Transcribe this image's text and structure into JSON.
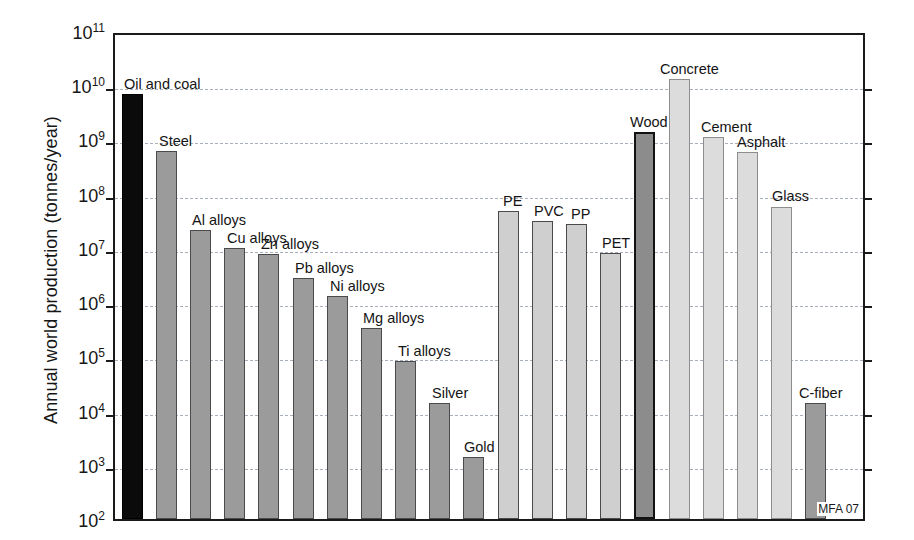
{
  "chart_data": {
    "type": "bar",
    "title": "",
    "subtitle": "",
    "xlabel": "",
    "ylabel": "Annual world production (tonnes/year)",
    "yscale": "log",
    "ylim": [
      100,
      100000000000
    ],
    "grid": true,
    "legend": null,
    "annotation": "MFA 07",
    "ytick_labels": [
      "10²",
      "10³",
      "10⁴",
      "10⁵",
      "10⁶",
      "10⁷",
      "10⁸",
      "10⁹",
      "10¹⁰",
      "10¹¹"
    ],
    "ytick_values": [
      100,
      1000,
      10000,
      100000,
      1000000,
      10000000,
      100000000,
      1000000000,
      10000000000,
      100000000000
    ],
    "categories": [
      "Oil and coal",
      "Steel",
      "Al alloys",
      "Cu alloys",
      "Zn alloys",
      "Pb alloys",
      "Ni alloys",
      "Mg alloys",
      "Ti alloys",
      "Silver",
      "Gold",
      "PE",
      "PVC",
      "PP",
      "PET",
      "Wood",
      "Concrete",
      "Cement",
      "Asphalt",
      "Glass",
      "C-fiber"
    ],
    "values": [
      7000000000,
      600000000,
      21000000,
      10000000,
      7800000,
      2800000,
      1300000,
      330000,
      82000,
      14000,
      1400,
      48000000,
      31000000,
      28000000,
      8000000,
      1350000000,
      13000000000,
      1100000000,
      580000000,
      58000000,
      14000
    ],
    "bars": [
      {
        "label": "Oil and coal",
        "value": 7000000000,
        "slot": 0,
        "class": "fuel",
        "label_dx": 2,
        "label_dy": -21
      },
      {
        "label": "Steel",
        "value": 600000000,
        "slot": 1,
        "class": "metal",
        "label_dx": 3,
        "label_dy": -21
      },
      {
        "label": "Al alloys",
        "value": 21000000,
        "slot": 2,
        "class": "metal",
        "label_dx": 2,
        "label_dy": -21
      },
      {
        "label": "Cu alloys",
        "value": 10000000,
        "slot": 3,
        "class": "metal",
        "label_dx": 3,
        "label_dy": -21
      },
      {
        "label": "Zn alloys",
        "value": 7800000,
        "slot": 4,
        "class": "metal",
        "label_dx": 3,
        "label_dy": -21
      },
      {
        "label": "Pb alloys",
        "value": 2800000,
        "slot": 5,
        "class": "metal",
        "label_dx": 2,
        "label_dy": -21
      },
      {
        "label": "Ni alloys",
        "value": 1300000,
        "slot": 6,
        "class": "metal",
        "label_dx": 3,
        "label_dy": -21
      },
      {
        "label": "Mg alloys",
        "value": 330000,
        "slot": 7,
        "class": "metal",
        "label_dx": 2,
        "label_dy": -21
      },
      {
        "label": "Ti alloys",
        "value": 82000,
        "slot": 8,
        "class": "metal",
        "label_dx": 3,
        "label_dy": -21
      },
      {
        "label": "Silver",
        "value": 14000,
        "slot": 9,
        "class": "metal",
        "label_dx": 3,
        "label_dy": -21
      },
      {
        "label": "Gold",
        "value": 1400,
        "slot": 10,
        "class": "metal",
        "label_dx": 1,
        "label_dy": -21
      },
      {
        "label": "PE",
        "value": 48000000,
        "slot": 11,
        "class": "polymer",
        "label_dx": 5,
        "label_dy": -21
      },
      {
        "label": "PVC",
        "value": 31000000,
        "slot": 12,
        "class": "polymer",
        "label_dx": 2,
        "label_dy": -21
      },
      {
        "label": "PP",
        "value": 28000000,
        "slot": 13,
        "class": "polymer",
        "label_dx": 5,
        "label_dy": -21
      },
      {
        "label": "PET",
        "value": 8000000,
        "slot": 14,
        "class": "polymer",
        "label_dx": 2,
        "label_dy": -21
      },
      {
        "label": "Wood",
        "value": 1350000000,
        "slot": 15,
        "class": "natural",
        "label_dx": -4,
        "label_dy": -21
      },
      {
        "label": "Concrete",
        "value": 13000000000,
        "slot": 16,
        "class": "ceramic",
        "label_dx": -9,
        "label_dy": -21
      },
      {
        "label": "Cement",
        "value": 1100000000,
        "slot": 17,
        "class": "ceramic",
        "label_dx": -2,
        "label_dy": -21
      },
      {
        "label": "Asphalt",
        "value": 580000000,
        "slot": 18,
        "class": "ceramic",
        "label_dx": 0,
        "label_dy": -21
      },
      {
        "label": "Glass",
        "value": 58000000,
        "slot": 19,
        "class": "ceramic",
        "label_dx": 1,
        "label_dy": -21
      },
      {
        "label": "C-fiber",
        "value": 14000,
        "slot": 20,
        "class": "composite",
        "label_dx": -6,
        "label_dy": -21
      }
    ],
    "slot_count": 22,
    "gap_slot": 15
  },
  "colors": {
    "fuel": "#0b0b0b",
    "metal": "#9b9b9b",
    "polymer": "#cfcfcf",
    "natural": "#8c8c8c",
    "ceramic": "#dcdcdc",
    "composite": "#9b9b9b",
    "axis": "#1a1a1a",
    "gridline": "#9aa3b0",
    "background": "#ffffff"
  }
}
